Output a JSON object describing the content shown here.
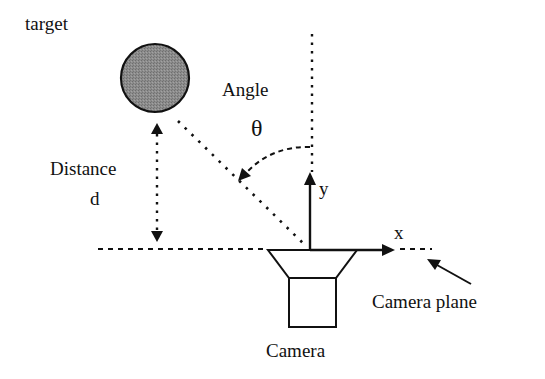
{
  "diagram": {
    "labels": {
      "target": "target",
      "angle": "Angle",
      "theta": "θ",
      "distance": "Distance",
      "distance_symbol": "d",
      "x_axis": "x",
      "y_axis": "y",
      "camera": "Camera",
      "camera_plane": "Camera plane"
    },
    "colors": {
      "stroke": "#111111",
      "target_fill": "#8a8a8a",
      "background": "#ffffff"
    },
    "nodes": [
      {
        "id": "target",
        "shape": "circle",
        "label": "target"
      },
      {
        "id": "camera",
        "shape": "camera-icon",
        "label": "Camera"
      }
    ],
    "edges": [
      {
        "from": "target",
        "to": "camera-plane",
        "style": "dotted",
        "label": "Distance d",
        "bidirectional": true
      },
      {
        "from": "target",
        "to": "camera",
        "style": "dotted",
        "label": "line of sight"
      },
      {
        "from": "y-axis",
        "to": "line of sight",
        "style": "dashed-arc",
        "label": "Angle θ"
      }
    ]
  }
}
